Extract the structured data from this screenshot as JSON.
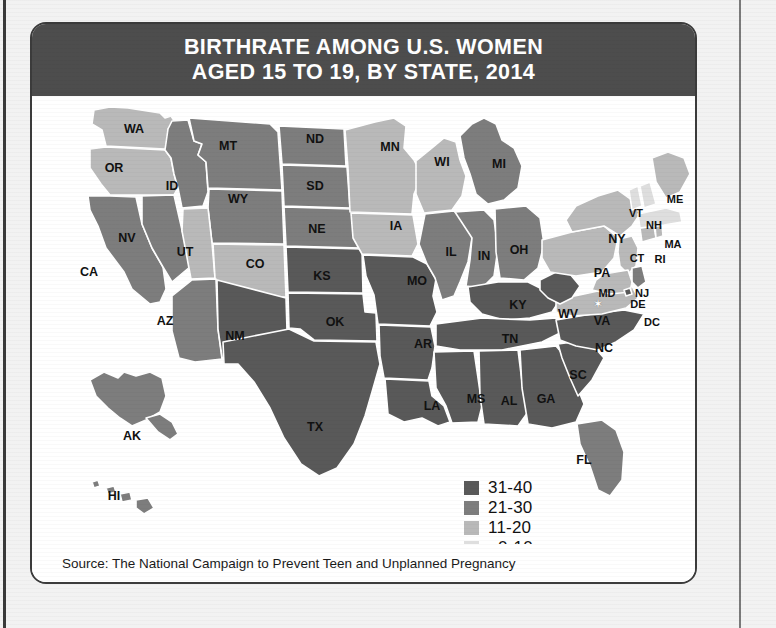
{
  "title": {
    "line1": "BIRTHRATE AMONG U.S. WOMEN",
    "line2": "AGED 15 TO 19, BY STATE, 2014"
  },
  "source": {
    "text": "Source: The National Campaign to Prevent Teen and Unplanned Pregnancy"
  },
  "colors": {
    "tier_31_40": "#595959",
    "tier_21_30": "#7d7d7d",
    "tier_11_20": "#b9b9b9",
    "tier_0_10": "#dedede",
    "banner": "#4d4d4d",
    "border": "#3b3b3b",
    "state_outline": "#ffffff",
    "page_background": "#f2f2f2"
  },
  "legend": {
    "title": "",
    "items": [
      {
        "label": "31-40",
        "color": "#595959",
        "tier": "tier_31_40"
      },
      {
        "label": "21-30",
        "color": "#7d7d7d",
        "tier": "tier_21_30"
      },
      {
        "label": "11-20",
        "color": "#b9b9b9",
        "tier": "tier_11_20"
      },
      {
        "label": "0-10",
        "color": "#dedede",
        "tier": "tier_0_10"
      }
    ]
  },
  "chart_data": {
    "type": "map",
    "title": "BIRTHRATE AMONG U.S. WOMEN AGED 15 TO 19, BY STATE, 2014",
    "subtitle": "",
    "xlabel": "",
    "ylabel": "Births per 1,000 women aged 15-19",
    "unit": "births per 1,000 women aged 15-19",
    "legend_position": "bottom-right",
    "grid": false,
    "bins": [
      {
        "label": "31-40",
        "min": 31,
        "max": 40,
        "color": "#595959"
      },
      {
        "label": "21-30",
        "min": 21,
        "max": 30,
        "color": "#7d7d7d"
      },
      {
        "label": "11-20",
        "min": 11,
        "max": 20,
        "color": "#b9b9b9"
      },
      {
        "label": "0-10",
        "min": 0,
        "max": 10,
        "color": "#dedede"
      }
    ],
    "states": [
      {
        "code": "WA",
        "bin": "11-20",
        "color": "#b9b9b9"
      },
      {
        "code": "OR",
        "bin": "11-20",
        "color": "#b9b9b9"
      },
      {
        "code": "CA",
        "bin": "21-30",
        "color": "#7d7d7d"
      },
      {
        "code": "NV",
        "bin": "21-30",
        "color": "#7d7d7d"
      },
      {
        "code": "ID",
        "bin": "21-30",
        "color": "#7d7d7d"
      },
      {
        "code": "MT",
        "bin": "21-30",
        "color": "#7d7d7d"
      },
      {
        "code": "WY",
        "bin": "21-30",
        "color": "#7d7d7d"
      },
      {
        "code": "UT",
        "bin": "11-20",
        "color": "#b9b9b9"
      },
      {
        "code": "CO",
        "bin": "11-20",
        "color": "#b9b9b9"
      },
      {
        "code": "AZ",
        "bin": "21-30",
        "color": "#7d7d7d"
      },
      {
        "code": "NM",
        "bin": "31-40",
        "color": "#595959"
      },
      {
        "code": "ND",
        "bin": "21-30",
        "color": "#7d7d7d"
      },
      {
        "code": "SD",
        "bin": "21-30",
        "color": "#7d7d7d"
      },
      {
        "code": "NE",
        "bin": "21-30",
        "color": "#7d7d7d"
      },
      {
        "code": "KS",
        "bin": "31-40",
        "color": "#595959"
      },
      {
        "code": "OK",
        "bin": "31-40",
        "color": "#595959"
      },
      {
        "code": "TX",
        "bin": "31-40",
        "color": "#595959"
      },
      {
        "code": "MN",
        "bin": "11-20",
        "color": "#b9b9b9"
      },
      {
        "code": "IA",
        "bin": "11-20",
        "color": "#b9b9b9"
      },
      {
        "code": "MO",
        "bin": "31-40",
        "color": "#595959"
      },
      {
        "code": "AR",
        "bin": "31-40",
        "color": "#595959"
      },
      {
        "code": "LA",
        "bin": "31-40",
        "color": "#595959"
      },
      {
        "code": "WI",
        "bin": "11-20",
        "color": "#b9b9b9"
      },
      {
        "code": "IL",
        "bin": "21-30",
        "color": "#7d7d7d"
      },
      {
        "code": "MI",
        "bin": "21-30",
        "color": "#7d7d7d"
      },
      {
        "code": "IN",
        "bin": "21-30",
        "color": "#7d7d7d"
      },
      {
        "code": "OH",
        "bin": "21-30",
        "color": "#7d7d7d"
      },
      {
        "code": "KY",
        "bin": "31-40",
        "color": "#595959"
      },
      {
        "code": "TN",
        "bin": "31-40",
        "color": "#595959"
      },
      {
        "code": "MS",
        "bin": "31-40",
        "color": "#595959"
      },
      {
        "code": "AL",
        "bin": "31-40",
        "color": "#595959"
      },
      {
        "code": "GA",
        "bin": "31-40",
        "color": "#595959"
      },
      {
        "code": "FL",
        "bin": "21-30",
        "color": "#7d7d7d"
      },
      {
        "code": "SC",
        "bin": "31-40",
        "color": "#595959"
      },
      {
        "code": "NC",
        "bin": "31-40",
        "color": "#595959"
      },
      {
        "code": "VA",
        "bin": "11-20",
        "color": "#b9b9b9"
      },
      {
        "code": "WV",
        "bin": "31-40",
        "color": "#595959"
      },
      {
        "code": "PA",
        "bin": "11-20",
        "color": "#b9b9b9"
      },
      {
        "code": "NY",
        "bin": "11-20",
        "color": "#b9b9b9"
      },
      {
        "code": "NJ",
        "bin": "11-20",
        "color": "#b9b9b9"
      },
      {
        "code": "DE",
        "bin": "21-30",
        "color": "#7d7d7d"
      },
      {
        "code": "MD",
        "bin": "11-20",
        "color": "#b9b9b9"
      },
      {
        "code": "DC",
        "bin": "31-40",
        "color": "#595959"
      },
      {
        "code": "CT",
        "bin": "11-20",
        "color": "#b9b9b9"
      },
      {
        "code": "RI",
        "bin": "11-20",
        "color": "#b9b9b9"
      },
      {
        "code": "MA",
        "bin": "0-10",
        "color": "#dedede"
      },
      {
        "code": "VT",
        "bin": "0-10",
        "color": "#dedede"
      },
      {
        "code": "NH",
        "bin": "0-10",
        "color": "#dedede"
      },
      {
        "code": "ME",
        "bin": "11-20",
        "color": "#b9b9b9"
      },
      {
        "code": "AK",
        "bin": "21-30",
        "color": "#7d7d7d"
      },
      {
        "code": "HI",
        "bin": "21-30",
        "color": "#7d7d7d"
      }
    ]
  },
  "map": {
    "labels": [
      {
        "code": "WA",
        "x": 102,
        "y": 33
      },
      {
        "code": "OR",
        "x": 82,
        "y": 72
      },
      {
        "code": "ID",
        "x": 140,
        "y": 90
      },
      {
        "code": "MT",
        "x": 196,
        "y": 50
      },
      {
        "code": "WY",
        "x": 206,
        "y": 103
      },
      {
        "code": "NV",
        "x": 95,
        "y": 142
      },
      {
        "code": "CA",
        "x": 57,
        "y": 176
      },
      {
        "code": "UT",
        "x": 153,
        "y": 156
      },
      {
        "code": "CO",
        "x": 223,
        "y": 168
      },
      {
        "code": "AZ",
        "x": 133,
        "y": 225
      },
      {
        "code": "NM",
        "x": 203,
        "y": 240
      },
      {
        "code": "ND",
        "x": 283,
        "y": 43
      },
      {
        "code": "SD",
        "x": 283,
        "y": 90
      },
      {
        "code": "NE",
        "x": 285,
        "y": 133
      },
      {
        "code": "KS",
        "x": 290,
        "y": 180
      },
      {
        "code": "OK",
        "x": 303,
        "y": 226
      },
      {
        "code": "TX",
        "x": 283,
        "y": 331
      },
      {
        "code": "MN",
        "x": 358,
        "y": 51
      },
      {
        "code": "IA",
        "x": 364,
        "y": 130
      },
      {
        "code": "MO",
        "x": 385,
        "y": 185
      },
      {
        "code": "AR",
        "x": 391,
        "y": 248
      },
      {
        "code": "LA",
        "x": 400,
        "y": 310
      },
      {
        "code": "WI",
        "x": 410,
        "y": 66
      },
      {
        "code": "IL",
        "x": 419,
        "y": 156
      },
      {
        "code": "MI",
        "x": 467,
        "y": 68
      },
      {
        "code": "IN",
        "x": 452,
        "y": 160
      },
      {
        "code": "OH",
        "x": 487,
        "y": 154
      },
      {
        "code": "KY",
        "x": 486,
        "y": 209
      },
      {
        "code": "TN",
        "x": 478,
        "y": 243
      },
      {
        "code": "MS",
        "x": 444,
        "y": 303
      },
      {
        "code": "AL",
        "x": 477,
        "y": 305
      },
      {
        "code": "GA",
        "x": 514,
        "y": 303
      },
      {
        "code": "FL",
        "x": 552,
        "y": 364
      },
      {
        "code": "SC",
        "x": 546,
        "y": 279
      },
      {
        "code": "NC",
        "x": 572,
        "y": 252
      },
      {
        "code": "VA",
        "x": 570,
        "y": 225
      },
      {
        "code": "WV",
        "x": 536,
        "y": 218
      },
      {
        "code": "PA",
        "x": 570,
        "y": 177
      },
      {
        "code": "NY",
        "x": 585,
        "y": 143
      },
      {
        "code": "NJ",
        "x": 610,
        "y": 197
      },
      {
        "code": "DE",
        "x": 606,
        "y": 208
      },
      {
        "code": "MD",
        "x": 575,
        "y": 197
      },
      {
        "code": "DC",
        "x": 620,
        "y": 226
      },
      {
        "code": "CT",
        "x": 605,
        "y": 162
      },
      {
        "code": "RI",
        "x": 628,
        "y": 163
      },
      {
        "code": "MA",
        "x": 641,
        "y": 148
      },
      {
        "code": "VT",
        "x": 604,
        "y": 117
      },
      {
        "code": "NH",
        "x": 622,
        "y": 129
      },
      {
        "code": "ME",
        "x": 643,
        "y": 103
      },
      {
        "code": "AK",
        "x": 100,
        "y": 340
      },
      {
        "code": "HI",
        "x": 82,
        "y": 400
      }
    ],
    "dc_marker": {
      "symbol": "✶",
      "x": 566,
      "y": 208
    }
  }
}
